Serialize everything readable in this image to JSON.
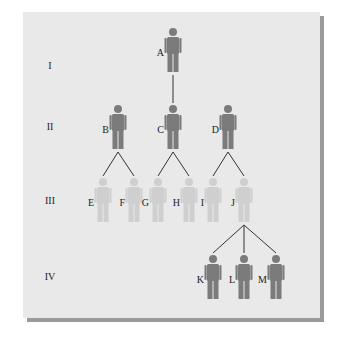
{
  "colors": {
    "panel": "#e9e9e9",
    "shadow": "#9a9a9a",
    "affected": "#7b7b7b",
    "unaffected": "#cfcfcf",
    "line": "#333333",
    "text": "#222222"
  },
  "generations": [
    {
      "label": "I",
      "y": 65
    },
    {
      "label": "II",
      "y": 126
    },
    {
      "label": "III",
      "y": 200
    },
    {
      "label": "IV",
      "y": 276
    }
  ],
  "individuals": [
    {
      "id": "A",
      "label": "A",
      "generation": "I",
      "x": 173,
      "y": 28,
      "affected": true
    },
    {
      "id": "B",
      "label": "B",
      "generation": "II",
      "x": 118,
      "y": 105,
      "affected": true
    },
    {
      "id": "C",
      "label": "C",
      "generation": "II",
      "x": 173,
      "y": 105,
      "affected": true
    },
    {
      "id": "D",
      "label": "D",
      "generation": "II",
      "x": 228,
      "y": 105,
      "affected": true
    },
    {
      "id": "E",
      "label": "E",
      "generation": "III",
      "x": 103,
      "y": 178,
      "affected": false
    },
    {
      "id": "F",
      "label": "F",
      "generation": "III",
      "x": 134,
      "y": 178,
      "affected": false
    },
    {
      "id": "G",
      "label": "G",
      "generation": "III",
      "x": 158,
      "y": 178,
      "affected": false
    },
    {
      "id": "H",
      "label": "H",
      "generation": "III",
      "x": 189,
      "y": 178,
      "affected": false
    },
    {
      "id": "I",
      "label": "I",
      "generation": "III",
      "x": 213,
      "y": 178,
      "affected": false
    },
    {
      "id": "J",
      "label": "J",
      "generation": "III",
      "x": 244,
      "y": 178,
      "affected": false
    },
    {
      "id": "K",
      "label": "K",
      "generation": "IV",
      "x": 213,
      "y": 255,
      "affected": true
    },
    {
      "id": "L",
      "label": "L",
      "generation": "IV",
      "x": 244,
      "y": 255,
      "affected": true
    },
    {
      "id": "M",
      "label": "M",
      "generation": "IV",
      "x": 276,
      "y": 255,
      "affected": true
    }
  ],
  "connections": [
    {
      "parent": "A",
      "children": [
        "C"
      ]
    },
    {
      "parent": "B",
      "children": [
        "E",
        "F"
      ]
    },
    {
      "parent": "C",
      "children": [
        "G",
        "H"
      ]
    },
    {
      "parent": "D",
      "children": [
        "I",
        "J"
      ]
    },
    {
      "parent": "J",
      "children": [
        "K",
        "L",
        "M"
      ]
    }
  ]
}
